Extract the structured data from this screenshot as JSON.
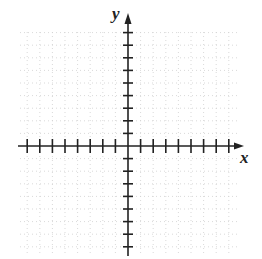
{
  "diagram": {
    "type": "coordinate-plane",
    "x_axis_label": "x",
    "y_axis_label": "y",
    "x_ticks_each_side": 8,
    "y_ticks_each_side": 9,
    "tick_spacing_px": 12.6,
    "grid": "dotted, light gray",
    "colors": {
      "axis": "#222222",
      "grid": "#c8c8c8"
    }
  }
}
